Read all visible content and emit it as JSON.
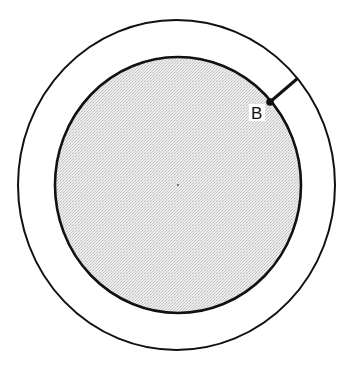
{
  "diagram": {
    "type": "concentric-circles",
    "colors": {
      "stroke": "#111111",
      "fill_inner": "#e4e4e4",
      "background": "#ffffff"
    },
    "outer_circle": {
      "cx": 176.5,
      "cy": 185,
      "rx": 158.5,
      "ry": 165
    },
    "inner_circle": {
      "cx": 178,
      "cy": 185,
      "rx": 123,
      "ry": 128,
      "shaded": true
    },
    "center_point": {
      "x": 178,
      "y": 185
    },
    "point_b": {
      "label": "B",
      "x": 270,
      "y": 102,
      "segment_to": {
        "x": 298,
        "y": 78
      }
    }
  }
}
